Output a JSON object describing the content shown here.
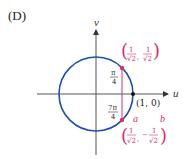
{
  "panel_label": "(D)",
  "axes": {
    "x_label": "u",
    "y_label": "v"
  },
  "colors": {
    "circle": "#1f4fa8",
    "highlight": "#d6336c",
    "axis": "#333333"
  },
  "points": {
    "p1": {
      "angle": "π/4",
      "angle_num": "π",
      "angle_den": "4",
      "coord_num": "1",
      "coord_den": "√2",
      "coord_x_sign": "",
      "coord_y_sign": ""
    },
    "p2": {
      "angle": "7π/4",
      "angle_num": "7π",
      "angle_den": "4",
      "coord_num": "1",
      "coord_den": "√2",
      "coord_x_sign": "",
      "coord_y_sign": "−"
    },
    "origin_point": "(1, 0)"
  },
  "annotation": {
    "a": "a",
    "b": "b"
  }
}
